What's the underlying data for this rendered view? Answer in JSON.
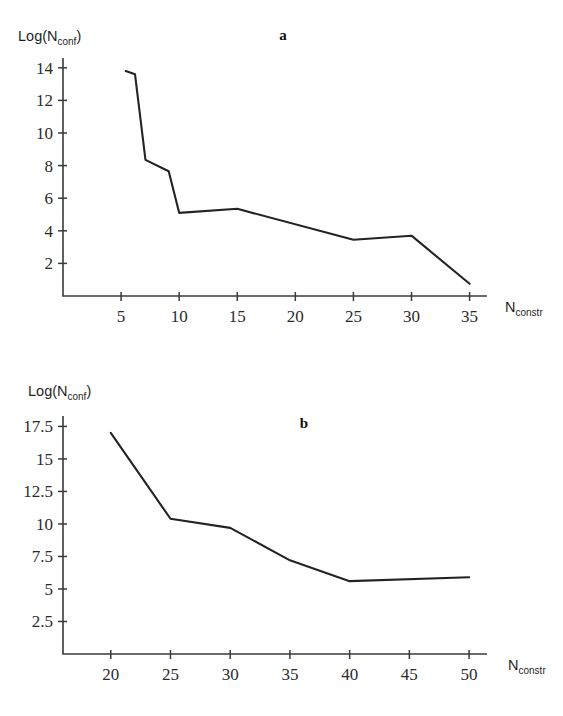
{
  "figure": {
    "background_color": "#ffffff",
    "line_color": "#232323",
    "axis_color": "#3a3a3a"
  },
  "panels": {
    "a": {
      "letter": "a",
      "ylabel_main": "Log(N",
      "ylabel_sub": "conf",
      "ylabel_close": ")",
      "xlabel_main": "N",
      "xlabel_sub": "constr"
    },
    "b": {
      "letter": "b",
      "ylabel_main": "Log(N",
      "ylabel_sub": "conf",
      "ylabel_close": ")",
      "xlabel_main": "N",
      "xlabel_sub": "constr"
    }
  },
  "chart_data": [
    {
      "id": "a",
      "type": "line",
      "title": "a",
      "xlabel": "N_constr",
      "ylabel": "Log(N_conf)",
      "xlim": [
        0,
        36.5
      ],
      "ylim": [
        0,
        14.6
      ],
      "xticks": [
        5,
        10,
        15,
        20,
        25,
        30,
        35
      ],
      "xtick_labels": [
        "5",
        "10",
        "15",
        "20",
        "25",
        "30",
        "35"
      ],
      "yticks": [
        2,
        4,
        6,
        8,
        10,
        12,
        14
      ],
      "ytick_labels": [
        "2",
        "4",
        "6",
        "8",
        "10",
        "12",
        "14"
      ],
      "grid": false,
      "legend": "none",
      "series": [
        {
          "name": "Log(N_conf)",
          "x": [
            5.4,
            6.2,
            7.1,
            9.1,
            10.0,
            15.0,
            25.0,
            30.0,
            35.0
          ],
          "values": [
            13.8,
            13.6,
            8.35,
            7.65,
            5.1,
            5.35,
            3.45,
            3.7,
            0.75
          ]
        }
      ]
    },
    {
      "id": "b",
      "type": "line",
      "title": "b",
      "xlabel": "N_constr",
      "ylabel": "Log(N_conf)",
      "xlim": [
        16.0,
        51.5
      ],
      "ylim": [
        0,
        18.3
      ],
      "xticks": [
        20,
        25,
        30,
        35,
        40,
        45,
        50
      ],
      "xtick_labels": [
        "20",
        "25",
        "30",
        "35",
        "40",
        "45",
        "50"
      ],
      "yticks": [
        2.5,
        5,
        7.5,
        10,
        12.5,
        15,
        17.5
      ],
      "ytick_labels": [
        "2.5",
        "5",
        "7.5",
        "10",
        "12.5",
        "15",
        "17.5"
      ],
      "grid": false,
      "legend": "none",
      "series": [
        {
          "name": "Log(N_conf)",
          "x": [
            20.0,
            25.0,
            30.0,
            35.0,
            40.0,
            50.0
          ],
          "values": [
            17.0,
            10.4,
            9.7,
            7.2,
            5.6,
            5.9
          ]
        }
      ]
    }
  ]
}
